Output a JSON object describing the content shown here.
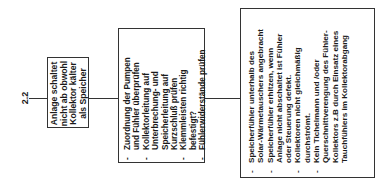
{
  "diagram": {
    "step_number": "2.2",
    "problem": {
      "lines": [
        "Anlage schaltet",
        "nicht ab obwohl",
        "Kollektor kälter",
        "als Speicher"
      ]
    },
    "checks": {
      "bullet": "-",
      "items": [
        {
          "lines": [
            "Zuordnung der Pumpen",
            "und Fühler überprüfen"
          ]
        },
        {
          "lines": [
            "Kollektorleitung auf",
            "Unterbrechung- und",
            "Speicherleitung auf",
            "Kurzschluß prüfen"
          ]
        },
        {
          "lines": [
            "Klemmleisten richtig",
            "befestigt?"
          ]
        },
        {
          "lines": [
            "Fühlerwiderstände prüfen"
          ]
        }
      ]
    },
    "causes": {
      "bullet": "-",
      "items": [
        {
          "lines": [
            "Speicherfühler unterhalb des",
            "Solar-Wärmetauschers angebracht"
          ]
        },
        {
          "lines": [
            "Speicherfühler erhitzen, wenn",
            "Anlage nicht abschaltet ist Fühler",
            "oder Steuerung defekt."
          ]
        },
        {
          "lines": [
            "Kollektoren nicht gleichmäßig",
            "durchströmt."
          ]
        },
        {
          "lines": [
            "Kein Tichelmann und /oder",
            "Querschnittverengung des Fühler-",
            "Kollektors z.B durch Einsatz eines",
            "Tauchfühlers im Kollektorabgang"
          ]
        }
      ]
    },
    "colors": {
      "line": "#333333",
      "text": "#1a1a1a",
      "background": "#ffffff"
    }
  }
}
